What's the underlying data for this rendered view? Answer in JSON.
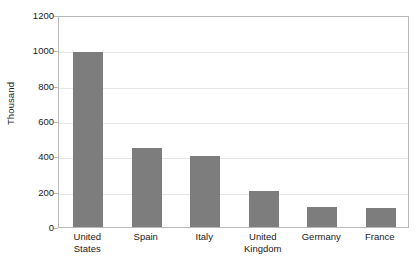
{
  "chart_data": {
    "type": "bar",
    "title": "",
    "subtitle": "",
    "xlabel": "",
    "ylabel": "Thousand",
    "categories": [
      "United States",
      "Spain",
      "Italy",
      "United Kingdom",
      "Germany",
      "France"
    ],
    "category_lines": [
      [
        "United",
        "States"
      ],
      [
        "Spain"
      ],
      [
        "Italy"
      ],
      [
        "United",
        "Kingdom"
      ],
      [
        "Germany"
      ],
      [
        "France"
      ]
    ],
    "values": [
      990,
      450,
      400,
      205,
      115,
      105
    ],
    "ylim": [
      0,
      1200
    ],
    "ytick_values": [
      0,
      200,
      400,
      600,
      800,
      1000,
      1200
    ],
    "ytick_labels": [
      "0",
      "200",
      "400",
      "600",
      "800",
      "1000",
      "1200"
    ],
    "grid": true,
    "grid_axis": "y",
    "legend": false,
    "legend_position": "none",
    "bar_color": "#7d7d7d",
    "grid_color": "#e6e6e6",
    "frame_color": "#b8b8b8",
    "text_color": "#1a1a1a",
    "background_color": "#ffffff"
  }
}
